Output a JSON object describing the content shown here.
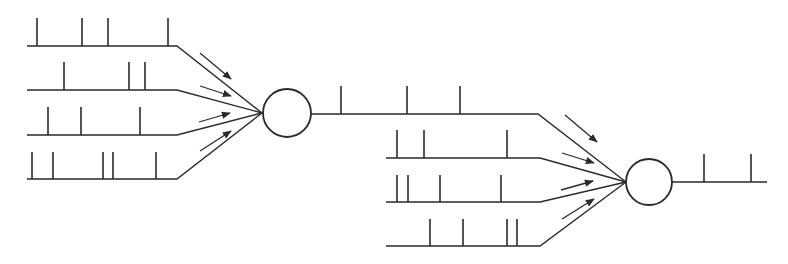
{
  "diagram": {
    "colors": {
      "stroke": "#2a2a2a",
      "background": "#ffffff"
    },
    "neurons": [
      {
        "id": "neuron-1",
        "cx": 287,
        "cy": 113,
        "r": 24,
        "inputs": [
          {
            "line_y": 46,
            "x_start": 27,
            "bend_x": 177,
            "spike_top": 18,
            "spikes": [
              37,
              82,
              108,
              168
            ]
          },
          {
            "line_y": 90,
            "x_start": 27,
            "bend_x": 177,
            "spike_top": 62,
            "spikes": [
              64,
              129,
              145
            ]
          },
          {
            "line_y": 135,
            "x_start": 27,
            "bend_x": 177,
            "spike_top": 107,
            "spikes": [
              48,
              81,
              140
            ]
          },
          {
            "line_y": 179,
            "x_start": 27,
            "bend_x": 177,
            "spike_top": 152,
            "spikes": [
              32,
              53,
              103,
              113,
              156
            ]
          }
        ],
        "converge": {
          "x": 262,
          "y": 113
        },
        "arrows": [
          {
            "x1": 200,
            "y1": 53,
            "x2": 231,
            "y2": 79
          },
          {
            "x1": 200,
            "y1": 86,
            "x2": 231,
            "y2": 96
          },
          {
            "x1": 199,
            "y1": 122,
            "x2": 230,
            "y2": 113
          },
          {
            "x1": 200,
            "y1": 151,
            "x2": 231,
            "y2": 131
          }
        ]
      },
      {
        "id": "neuron-2",
        "cx": 649,
        "cy": 182,
        "r": 23,
        "inputs": [
          {
            "line_y": 114,
            "x_start": 311,
            "bend_x": 538,
            "spike_top": 86,
            "spikes": [
              341,
              407,
              460
            ]
          },
          {
            "line_y": 158,
            "x_start": 386,
            "bend_x": 540,
            "spike_top": 130,
            "spikes": [
              397,
              424,
              507
            ]
          },
          {
            "line_y": 202,
            "x_start": 386,
            "bend_x": 540,
            "spike_top": 175,
            "spikes": [
              397,
              408,
              440,
              501
            ]
          },
          {
            "line_y": 246,
            "x_start": 386,
            "bend_x": 540,
            "spike_top": 219,
            "spikes": [
              430,
              463,
              507,
              517
            ]
          }
        ],
        "converge": {
          "x": 626,
          "y": 182
        },
        "arrows": [
          {
            "x1": 565,
            "y1": 115,
            "x2": 597,
            "y2": 142
          },
          {
            "x1": 562,
            "y1": 153,
            "x2": 594,
            "y2": 163
          },
          {
            "x1": 561,
            "y1": 190,
            "x2": 593,
            "y2": 181
          },
          {
            "x1": 562,
            "y1": 219,
            "x2": 594,
            "y2": 199
          }
        ]
      }
    ],
    "output": {
      "line_y": 182,
      "x_start": 672,
      "x_end": 767,
      "spike_top": 154,
      "spikes": [
        704,
        751
      ]
    }
  }
}
